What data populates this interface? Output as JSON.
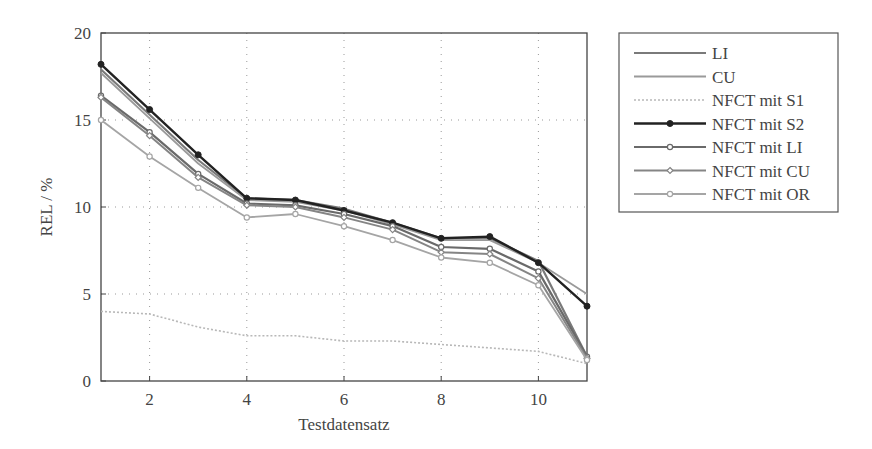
{
  "chart_data": {
    "type": "line",
    "title": "",
    "xlabel": "Testdatensatz",
    "ylabel": "REL / %",
    "xlim": [
      1,
      11
    ],
    "ylim": [
      0,
      20
    ],
    "x_ticks": [
      2,
      4,
      6,
      8,
      10
    ],
    "y_ticks": [
      0,
      5,
      10,
      15,
      20
    ],
    "grid": true,
    "legend_position": "outside-right-top",
    "x": [
      1,
      2,
      3,
      4,
      5,
      6,
      7,
      8,
      9,
      10,
      11
    ],
    "series": [
      {
        "name": "LI",
        "color": "#7a7a7a",
        "width": 2.2,
        "dash": "",
        "marker": "none",
        "values": [
          17.9,
          15.3,
          12.7,
          10.5,
          10.4,
          9.9,
          9.1,
          8.2,
          8.2,
          6.9,
          1.4
        ]
      },
      {
        "name": "CU",
        "color": "#9a9a9a",
        "width": 1.8,
        "dash": "",
        "marker": "none",
        "values": [
          17.7,
          15.1,
          12.5,
          10.4,
          10.3,
          9.8,
          9.0,
          8.1,
          8.1,
          6.8,
          5.0
        ]
      },
      {
        "name": "NFCT mit S1",
        "color": "#b8b8b8",
        "width": 1.6,
        "dash": "2,2",
        "marker": "none",
        "values": [
          4.0,
          3.85,
          3.1,
          2.6,
          2.6,
          2.3,
          2.3,
          2.1,
          1.9,
          1.7,
          1.0
        ]
      },
      {
        "name": "NFCT mit S2",
        "color": "#222222",
        "width": 2.4,
        "dash": "",
        "marker": "dot",
        "values": [
          18.2,
          15.6,
          13.0,
          10.5,
          10.4,
          9.8,
          9.1,
          8.2,
          8.3,
          6.8,
          4.3
        ]
      },
      {
        "name": "NFCT mit LI",
        "color": "#6a6a6a",
        "width": 2.2,
        "dash": "",
        "marker": "circle",
        "values": [
          16.4,
          14.3,
          11.9,
          10.2,
          10.1,
          9.6,
          8.9,
          7.7,
          7.6,
          6.3,
          1.4
        ]
      },
      {
        "name": "NFCT mit CU",
        "color": "#858585",
        "width": 2.0,
        "dash": "",
        "marker": "diamond",
        "values": [
          16.3,
          14.1,
          11.7,
          10.1,
          10.0,
          9.4,
          8.7,
          7.4,
          7.3,
          5.9,
          1.3
        ]
      },
      {
        "name": "NFCT mit OR",
        "color": "#a5a5a5",
        "width": 1.8,
        "dash": "",
        "marker": "circle",
        "values": [
          15.0,
          12.9,
          11.1,
          9.4,
          9.6,
          8.9,
          8.1,
          7.1,
          6.8,
          5.5,
          1.2
        ]
      }
    ]
  },
  "legend": {
    "items": [
      "LI",
      "CU",
      "NFCT mit S1",
      "NFCT mit S2",
      "NFCT mit LI",
      "NFCT mit CU",
      "NFCT mit OR"
    ]
  },
  "axes": {
    "xlabel": "Testdatensatz",
    "ylabel": "REL / %",
    "x_tick_labels": [
      "2",
      "4",
      "6",
      "8",
      "10"
    ],
    "y_tick_labels": [
      "0",
      "5",
      "10",
      "15",
      "20"
    ]
  }
}
